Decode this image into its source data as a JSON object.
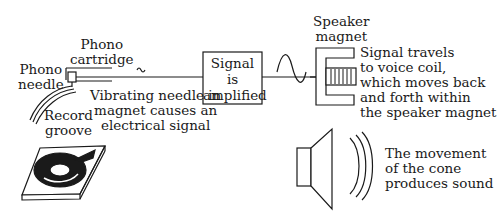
{
  "diagram": {
    "labels": {
      "phono_cartridge": [
        "Phono",
        "cartridge"
      ],
      "phono_needle": [
        "Phono",
        "needle"
      ],
      "record_groove": [
        "Record",
        "groove"
      ],
      "vibrating_needle": [
        "Vibrating needle in",
        "magnet causes an",
        "electrical signal"
      ],
      "amplifier_box": [
        "Signal",
        "is",
        "amplified"
      ],
      "speaker_magnet": [
        "Speaker",
        "magnet"
      ],
      "voice_coil": [
        "Signal travels",
        "to voice coil,",
        "which moves back",
        "and forth within",
        "the speaker magnet"
      ],
      "cone": [
        "The movement",
        "of the cone",
        "produces sound"
      ]
    },
    "colors": {
      "stroke": "#1a1a1a",
      "background": "#ffffff"
    }
  }
}
